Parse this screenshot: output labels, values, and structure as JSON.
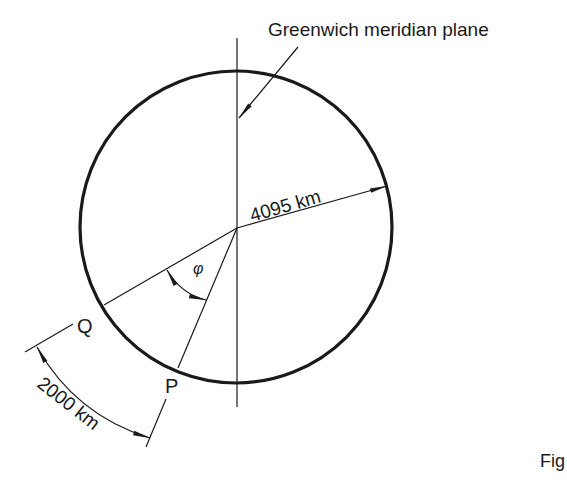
{
  "diagram": {
    "title_label": "Greenwich meridian plane",
    "radius_label": "4095 km",
    "arc_label": "2000 km",
    "angle_symbol": "φ",
    "point_q": "Q",
    "point_p": "P",
    "figure_caption_partial": "Fig"
  },
  "colors": {
    "ink": "#1a1a1a",
    "background": "#ffffff"
  }
}
